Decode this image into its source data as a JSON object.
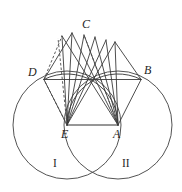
{
  "figure": {
    "colors": {
      "background": "#ffffff",
      "line": "#3a3a3a",
      "circle": "#4a4a4a",
      "dashed": "#4a4a4a",
      "label": "#1f1f1f"
    },
    "points": [
      {
        "id": "C",
        "label": "C",
        "x": 86,
        "y": 25
      },
      {
        "id": "D",
        "label": "D",
        "x": 32,
        "y": 73
      },
      {
        "id": "B",
        "label": "B",
        "x": 147,
        "y": 71
      },
      {
        "id": "E",
        "label": "E",
        "x": 65,
        "y": 135
      },
      {
        "id": "A",
        "label": "A",
        "x": 117,
        "y": 135
      }
    ],
    "regions": [
      {
        "id": "I",
        "label": "I",
        "x": 54,
        "y": 163
      },
      {
        "id": "II",
        "label": "II",
        "x": 124,
        "y": 163
      }
    ],
    "circles": [
      {
        "id": "circle-left",
        "cx": 67,
        "cy": 125,
        "r": 54
      },
      {
        "id": "circle-right",
        "cx": 118,
        "cy": 125,
        "r": 54
      }
    ],
    "arcs": [
      {
        "id": "arc-left-upper",
        "center": "E",
        "from": "A",
        "to": "D"
      },
      {
        "id": "arc-right-upper",
        "center": "A",
        "from": "E",
        "to": "B"
      }
    ],
    "segments": {
      "base": {
        "from": "E",
        "to": "A"
      },
      "chord": {
        "from": "D",
        "to": "B"
      },
      "fan_from_e_count": 6,
      "fan_from_a_count": 6,
      "dashed_count": 4
    }
  }
}
